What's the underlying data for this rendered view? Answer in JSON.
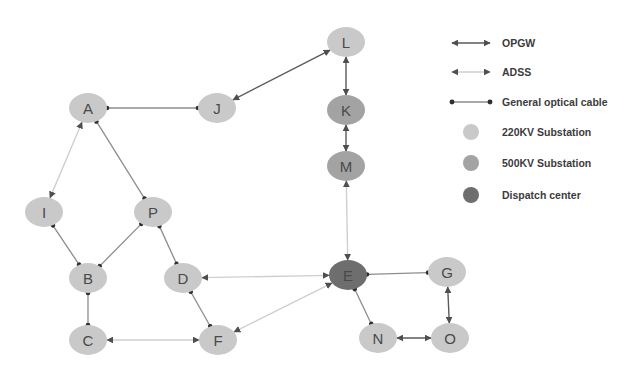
{
  "figure": {
    "type": "network-diagram",
    "background_color": "#ffffff"
  },
  "palette": {
    "substation_220kv": "#c9c9c9",
    "substation_500kv": "#a3a3a3",
    "dispatch_center": "#6e6e6e",
    "node_label_color": "#4a4a4a",
    "opgw_line": "#5a5a5a",
    "adss_line": "#cfcfcf",
    "general_cable_line": "#8d8d8d",
    "endpoint_dot": "#2f2f2f",
    "legend_text_color": "#3b3b3b"
  },
  "nodes": [
    {
      "id": "A",
      "label": "A",
      "x": 88,
      "y": 108,
      "type": "220KV Substation"
    },
    {
      "id": "J",
      "label": "J",
      "x": 217,
      "y": 108,
      "type": "220KV Substation"
    },
    {
      "id": "L",
      "label": "L",
      "x": 346,
      "y": 42,
      "type": "220KV Substation"
    },
    {
      "id": "K",
      "label": "K",
      "x": 346,
      "y": 110,
      "type": "500KV Substation"
    },
    {
      "id": "M",
      "label": "M",
      "x": 346,
      "y": 166,
      "type": "500KV Substation"
    },
    {
      "id": "I",
      "label": "I",
      "x": 44,
      "y": 212,
      "type": "220KV Substation"
    },
    {
      "id": "P",
      "label": "P",
      "x": 153,
      "y": 212,
      "type": "220KV Substation"
    },
    {
      "id": "B",
      "label": "B",
      "x": 88,
      "y": 278,
      "type": "220KV Substation"
    },
    {
      "id": "D",
      "label": "D",
      "x": 183,
      "y": 278,
      "type": "220KV Substation"
    },
    {
      "id": "C",
      "label": "C",
      "x": 88,
      "y": 340,
      "type": "220KV Substation"
    },
    {
      "id": "F",
      "label": "F",
      "x": 218,
      "y": 340,
      "type": "220KV Substation"
    },
    {
      "id": "E",
      "label": "E",
      "x": 348,
      "y": 275,
      "type": "Dispatch center"
    },
    {
      "id": "G",
      "label": "G",
      "x": 447,
      "y": 272,
      "type": "220KV Substation"
    },
    {
      "id": "N",
      "label": "N",
      "x": 378,
      "y": 338,
      "type": "220KV Substation"
    },
    {
      "id": "O",
      "label": "O",
      "x": 450,
      "y": 338,
      "type": "220KV Substation"
    }
  ],
  "edges": [
    {
      "from": "A",
      "to": "J",
      "link_type": "General optical cable"
    },
    {
      "from": "A",
      "to": "I",
      "link_type": "ADSS"
    },
    {
      "from": "A",
      "to": "P",
      "link_type": "General optical cable"
    },
    {
      "from": "I",
      "to": "B",
      "link_type": "General optical cable"
    },
    {
      "from": "P",
      "to": "B",
      "link_type": "General optical cable"
    },
    {
      "from": "B",
      "to": "C",
      "link_type": "General optical cable"
    },
    {
      "from": "P",
      "to": "D",
      "link_type": "General optical cable"
    },
    {
      "from": "D",
      "to": "F",
      "link_type": "General optical cable"
    },
    {
      "from": "C",
      "to": "F",
      "link_type": "ADSS"
    },
    {
      "from": "J",
      "to": "L",
      "link_type": "OPGW"
    },
    {
      "from": "L",
      "to": "K",
      "link_type": "OPGW"
    },
    {
      "from": "K",
      "to": "M",
      "link_type": "OPGW"
    },
    {
      "from": "M",
      "to": "E",
      "link_type": "ADSS"
    },
    {
      "from": "D",
      "to": "E",
      "link_type": "ADSS"
    },
    {
      "from": "F",
      "to": "E",
      "link_type": "ADSS"
    },
    {
      "from": "E",
      "to": "G",
      "link_type": "General optical cable"
    },
    {
      "from": "E",
      "to": "N",
      "link_type": "General optical cable"
    },
    {
      "from": "G",
      "to": "O",
      "link_type": "OPGW"
    },
    {
      "from": "N",
      "to": "O",
      "link_type": "OPGW"
    }
  ],
  "legend": {
    "items": [
      {
        "key": "opgw",
        "label": "OPGW",
        "marker": "double-arrow-dark",
        "y": 43
      },
      {
        "key": "adss",
        "label": "ADSS",
        "marker": "double-arrow-light",
        "y": 72
      },
      {
        "key": "general",
        "label": "General optical cable",
        "marker": "dot-ended-line",
        "y": 102
      },
      {
        "key": "sub220",
        "label": "220KV Substation",
        "marker": "circle-light",
        "y": 132
      },
      {
        "key": "sub500",
        "label": "500KV Substation",
        "marker": "circle-medium",
        "y": 163
      },
      {
        "key": "dispatch",
        "label": "Dispatch center",
        "marker": "circle-dark",
        "y": 195
      }
    ],
    "marker_x_start": 452,
    "marker_x_end": 490,
    "text_x": 502
  }
}
